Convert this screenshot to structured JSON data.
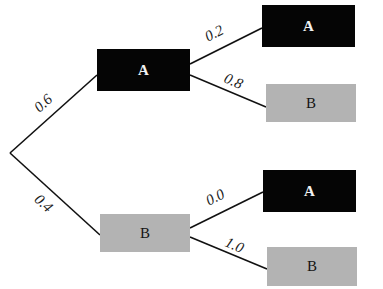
{
  "diagram": {
    "type": "probability-tree",
    "colors": {
      "event_A_fill": "#050505",
      "event_B_fill": "#b3b3b3",
      "edge": "#111111"
    },
    "root": {
      "x": 10,
      "y": 153
    },
    "level1": [
      {
        "id": "l1_A",
        "label": "A",
        "style": "dark",
        "prob": "0.6",
        "x": 97,
        "y": 49,
        "w": 93,
        "h": 42
      },
      {
        "id": "l1_B",
        "label": "B",
        "style": "light",
        "prob": "0.4",
        "x": 100,
        "y": 214,
        "w": 90,
        "h": 38
      }
    ],
    "level2": [
      {
        "id": "l2_AA",
        "parent": "l1_A",
        "label": "A",
        "style": "dark",
        "prob": "0.2",
        "x": 262,
        "y": 5,
        "w": 93,
        "h": 42
      },
      {
        "id": "l2_AB",
        "parent": "l1_A",
        "label": "B",
        "style": "light",
        "prob": "0.8",
        "x": 266,
        "y": 84,
        "w": 90,
        "h": 38
      },
      {
        "id": "l2_BA",
        "parent": "l1_B",
        "label": "A",
        "style": "dark",
        "prob": "0.0",
        "x": 263,
        "y": 170,
        "w": 93,
        "h": 42
      },
      {
        "id": "l2_BB",
        "parent": "l1_B",
        "label": "B",
        "style": "light",
        "prob": "1.0",
        "x": 267,
        "y": 247,
        "w": 90,
        "h": 39
      }
    ]
  }
}
